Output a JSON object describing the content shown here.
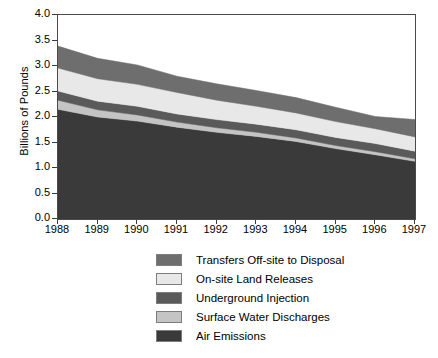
{
  "chart_data": {
    "type": "area",
    "title": "",
    "xlabel": "",
    "ylabel": "Billions of Pounds",
    "grid": false,
    "stacked": true,
    "legend_position": "bottom",
    "xlim": [
      1988,
      1997
    ],
    "ylim": [
      0.0,
      4.0
    ],
    "ytick_labels": [
      "0.0",
      "0.5",
      "1.0",
      "1.5",
      "2.0",
      "2.5",
      "3.0",
      "3.5",
      "4.0"
    ],
    "ytick_values": [
      0.0,
      0.5,
      1.0,
      1.5,
      2.0,
      2.5,
      3.0,
      3.5,
      4.0
    ],
    "categories": [
      "1988",
      "1989",
      "1990",
      "1991",
      "1992",
      "1993",
      "1994",
      "1995",
      "1996",
      "1997"
    ],
    "x": [
      1988,
      1989,
      1990,
      1991,
      1992,
      1993,
      1994,
      1995,
      1996,
      1997
    ],
    "series": [
      {
        "name": "Air Emissions",
        "color": "#3a3a3a",
        "values": [
          2.15,
          2.0,
          1.92,
          1.8,
          1.7,
          1.62,
          1.52,
          1.38,
          1.26,
          1.13
        ]
      },
      {
        "name": "Surface Water Discharges",
        "color": "#c4c4c4",
        "values": [
          0.18,
          0.14,
          0.12,
          0.1,
          0.09,
          0.08,
          0.07,
          0.06,
          0.06,
          0.05
        ]
      },
      {
        "name": "Underground Injection",
        "color": "#5a5a5a",
        "values": [
          0.18,
          0.17,
          0.17,
          0.16,
          0.16,
          0.16,
          0.16,
          0.16,
          0.16,
          0.15
        ]
      },
      {
        "name": "On-site Land Releases",
        "color": "#e8e8e8",
        "values": [
          0.45,
          0.44,
          0.43,
          0.42,
          0.38,
          0.35,
          0.33,
          0.31,
          0.29,
          0.28
        ]
      },
      {
        "name": "Transfers Off-site to Disposal",
        "color": "#6e6e6e",
        "values": [
          0.43,
          0.4,
          0.38,
          0.32,
          0.32,
          0.31,
          0.3,
          0.28,
          0.24,
          0.34
        ]
      }
    ],
    "series_draw_order_bottom_to_top": [
      "Air Emissions",
      "Surface Water Discharges",
      "Underground Injection",
      "On-site Land Releases",
      "Transfers Off-site to Disposal"
    ],
    "cumulative_totals": [
      3.39,
      3.15,
      3.02,
      2.8,
      2.65,
      2.52,
      2.38,
      2.19,
      2.01,
      1.95
    ]
  },
  "legend": {
    "items": [
      {
        "label": "Transfers Off-site to Disposal",
        "color": "#6e6e6e"
      },
      {
        "label": "On-site Land Releases",
        "color": "#e8e8e8"
      },
      {
        "label": "Underground Injection",
        "color": "#5a5a5a"
      },
      {
        "label": "Surface Water Discharges",
        "color": "#c4c4c4"
      },
      {
        "label": "Air Emissions",
        "color": "#3a3a3a"
      }
    ]
  },
  "axes": {
    "y_title": "Billions of Pounds",
    "frame_color": "#4a4a4a",
    "tick_color": "#3a3a3a"
  }
}
